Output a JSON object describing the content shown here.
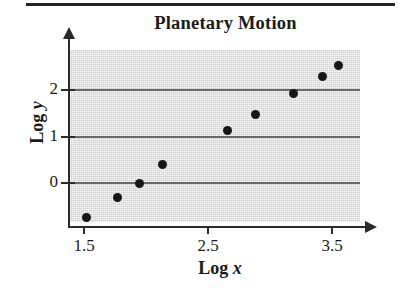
{
  "figure": {
    "top_rule": "page-rule",
    "background_color": "#ffffff",
    "plot_band_color": "#cfcfcf",
    "axis_color": "#2a2a2a",
    "gridline_color": "#6a6a6a",
    "marker_color": "#171717"
  },
  "chart_data": {
    "type": "scatter",
    "title": "Planetary Motion",
    "xlabel_prefix": "Log ",
    "xlabel_var": "x",
    "ylabel_prefix": "Log ",
    "ylabel_var": "y",
    "xlabel": "Log x",
    "ylabel": "Log y",
    "xticks": [
      1.5,
      2.5,
      3.5
    ],
    "xtick_labels": [
      "1.5",
      "2.5",
      "3.5"
    ],
    "yticks": [
      0,
      1,
      2
    ],
    "ytick_labels": [
      "0",
      "1",
      "2"
    ],
    "xlim": [
      1.38,
      3.72
    ],
    "ylim": [
      -0.95,
      2.76
    ],
    "grid": true,
    "grid_axis": "y",
    "legend": null,
    "points": [
      {
        "x": 1.52,
        "y": -0.75
      },
      {
        "x": 1.77,
        "y": -0.32
      },
      {
        "x": 1.95,
        "y": 0.0
      },
      {
        "x": 2.13,
        "y": 0.4
      },
      {
        "x": 2.66,
        "y": 1.13
      },
      {
        "x": 2.88,
        "y": 1.48
      },
      {
        "x": 3.19,
        "y": 1.93
      },
      {
        "x": 3.42,
        "y": 2.3
      },
      {
        "x": 3.55,
        "y": 2.52
      }
    ],
    "x": [
      1.52,
      1.77,
      1.95,
      2.13,
      2.66,
      2.88,
      3.19,
      3.42,
      3.55
    ],
    "values": [
      -0.75,
      -0.32,
      0.0,
      0.4,
      1.13,
      1.48,
      1.93,
      2.3,
      2.52
    ]
  }
}
